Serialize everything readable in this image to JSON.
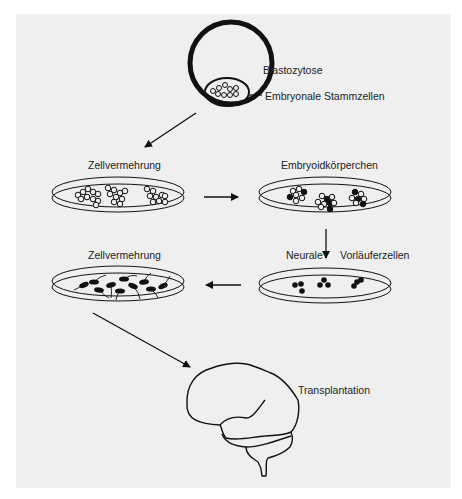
{
  "diagram": {
    "background_color": "#efefef",
    "stroke_color": "#111111",
    "labels": {
      "blastocyst": "Blastozytose",
      "embryonic_stem_cells": "Embryonale Stammzellen",
      "proliferation_1": "Zellvermehrung",
      "embryoid_bodies": "Embryoidkörperchen",
      "neural": "Neurale",
      "progenitor_cells": "Vorläuferzellen",
      "proliferation_2": "Zellvermehrung",
      "transplantation": "Transplantation"
    },
    "steps": [
      {
        "id": "blastocyst",
        "label": "Blastozytose"
      },
      {
        "id": "stem-cells-dish",
        "label": "Zellvermehrung"
      },
      {
        "id": "embryoid-dish",
        "label": "Embryoidkörperchen"
      },
      {
        "id": "neural-progenitor-dish",
        "label": "Neurale Vorläuferzellen"
      },
      {
        "id": "expanded-neurons-dish",
        "label": "Zellvermehrung"
      },
      {
        "id": "brain",
        "label": "Transplantation"
      }
    ],
    "flow": [
      [
        "blastocyst",
        "stem-cells-dish"
      ],
      [
        "stem-cells-dish",
        "embryoid-dish"
      ],
      [
        "embryoid-dish",
        "neural-progenitor-dish"
      ],
      [
        "neural-progenitor-dish",
        "expanded-neurons-dish"
      ],
      [
        "expanded-neurons-dish",
        "brain"
      ]
    ]
  }
}
